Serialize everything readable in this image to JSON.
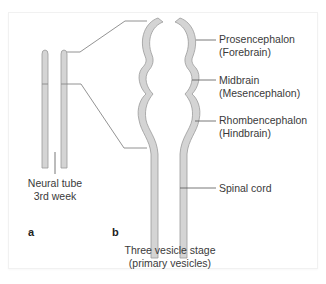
{
  "figure": {
    "panels": [
      {
        "letter": "a",
        "caption_line1": "Neural tube",
        "caption_line2": "3rd week"
      },
      {
        "letter": "b",
        "caption_line1": "Three vesicle stage",
        "caption_line2": "(primary vesicles)"
      }
    ],
    "labels": [
      {
        "name": "Prosencephalon",
        "alt": "(Forebrain)"
      },
      {
        "name": "Midbrain",
        "alt": "(Mesencephalon)"
      },
      {
        "name": "Rhombencephalon",
        "alt": "(Hindbrain)"
      },
      {
        "name": "Spinal cord",
        "alt": ""
      }
    ],
    "colors": {
      "tube_fill": "#d4d4d4",
      "tube_outline": "#9a9a9a",
      "leader_line": "#555555",
      "text": "#3a3a3a"
    }
  }
}
